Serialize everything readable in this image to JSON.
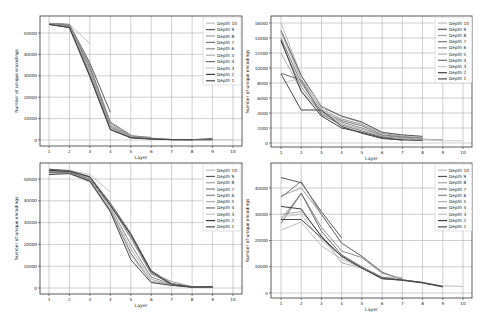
{
  "chart_data": [
    {
      "id": "top-left",
      "type": "line",
      "title": "",
      "xlabel": "Layer",
      "ylabel": "Number of unique encodings",
      "x": [
        1,
        2,
        3,
        4,
        5,
        6,
        7,
        8,
        9,
        10
      ],
      "xticks": [
        "1",
        "2",
        "3",
        "4",
        "5",
        "6",
        "7",
        "8",
        "9",
        "10"
      ],
      "yticks": [
        0,
        10000,
        20000,
        30000,
        40000,
        50000
      ],
      "ytick_labels": [
        "0",
        "10000",
        "20000",
        "30000",
        "40000",
        "50000"
      ],
      "ylim": [
        -2500,
        56000
      ],
      "grid": true,
      "legend_position": "upper right",
      "frame": {
        "left": 40,
        "right": 242,
        "top": 16,
        "bottom": 146,
        "x1px": 49,
        "x10px": 233,
        "y0px": 140,
        "yrefpx": 33,
        "yref": 50000
      },
      "legend_box": {
        "x": 203,
        "y": 17,
        "w": 38,
        "h": 68
      },
      "series": [
        {
          "name": "Depth 10",
          "color": "#bdbdbd",
          "values": [
            54500,
            54000,
            45000
          ]
        },
        {
          "name": "Depth 9",
          "color": "#5a5a5a",
          "values": [
            54500,
            54000,
            36000,
            13000
          ]
        },
        {
          "name": "Depth 8",
          "color": "#a0a0a0",
          "values": [
            54500,
            53800,
            35000,
            8500,
            2500
          ]
        },
        {
          "name": "Depth 7",
          "color": "#7a7a7a",
          "values": [
            54400,
            53500,
            34000,
            8000,
            2000,
            1200
          ]
        },
        {
          "name": "Depth 6",
          "color": "#8c8c8c",
          "values": [
            54300,
            53200,
            33000,
            7000,
            1800,
            900,
            300
          ]
        },
        {
          "name": "Depth 5",
          "color": "#b0b0b0",
          "values": [
            54200,
            53000,
            32000,
            6500,
            1500,
            700,
            250,
            200
          ]
        },
        {
          "name": "Depth 4",
          "color": "#6e6e6e",
          "values": [
            54100,
            53000,
            31000,
            6000,
            1300,
            600,
            200,
            150,
            800
          ]
        },
        {
          "name": "Depth 3",
          "color": "#c8c8c8",
          "values": [
            54000,
            52800,
            30500,
            5500,
            1200,
            500,
            200,
            150,
            100,
            100
          ]
        },
        {
          "name": "Depth 2",
          "color": "#3c3c3c",
          "values": [
            54000,
            52600,
            30000,
            5000,
            1100,
            500,
            150,
            100,
            100
          ]
        },
        {
          "name": "Depth 1",
          "color": "#4a4a4a",
          "values": [
            54000,
            52500,
            29500,
            4800,
            1000,
            400,
            150,
            100
          ]
        }
      ]
    },
    {
      "id": "top-right",
      "type": "line",
      "title": "",
      "xlabel": "Layer",
      "ylabel": "Number of unique encodings",
      "x": [
        1,
        2,
        3,
        4,
        5,
        6,
        7,
        8,
        9,
        10
      ],
      "xticks": [
        "1",
        "2",
        "3",
        "4",
        "5",
        "6",
        "7",
        "8",
        "9",
        "10"
      ],
      "yticks": [
        0,
        2000,
        4000,
        6000,
        8000,
        10000,
        12000,
        14000,
        16000
      ],
      "ytick_labels": [
        "0",
        "2000",
        "4000",
        "6000",
        "8000",
        "10000",
        "12000",
        "14000",
        "16000"
      ],
      "ylim": [
        -500,
        17000
      ],
      "grid": true,
      "legend_position": "upper right",
      "frame": {
        "left": 271,
        "right": 472,
        "top": 16,
        "bottom": 147,
        "x1px": 281,
        "x10px": 463,
        "y0px": 143,
        "yrefpx": 23,
        "yref": 16000
      },
      "legend_box": {
        "x": 435,
        "y": 17,
        "w": 37,
        "h": 66
      },
      "series": [
        {
          "name": "Depth 10",
          "color": "#bdbdbd",
          "values": [
            16000,
            9000,
            5000,
            3500,
            2700,
            1500,
            1000,
            800
          ]
        },
        {
          "name": "Depth 9",
          "color": "#5a5a5a",
          "values": [
            15000,
            9000,
            4800,
            3600,
            2800,
            1400,
            1100,
            900
          ]
        },
        {
          "name": "Depth 8",
          "color": "#a0a0a0",
          "values": [
            14800,
            8500,
            4500,
            3200,
            2500,
            1300,
            900,
            700
          ]
        },
        {
          "name": "Depth 7",
          "color": "#7a7a7a",
          "values": [
            14000,
            8000,
            4200,
            3000,
            2300,
            1100,
            800,
            600
          ]
        },
        {
          "name": "Depth 6",
          "color": "#8c8c8c",
          "values": [
            13500,
            7500,
            4000,
            2800,
            2000,
            1000,
            700,
            500,
            400
          ]
        },
        {
          "name": "Depth 5",
          "color": "#b0b0b0",
          "values": [
            12000,
            7000,
            4000,
            2600,
            1800,
            900,
            600,
            500,
            400
          ]
        },
        {
          "name": "Depth 4",
          "color": "#6e6e6e",
          "values": [
            9300,
            8400,
            3800,
            2400,
            1600,
            800,
            500,
            400
          ]
        },
        {
          "name": "Depth 3",
          "color": "#c8c8c8",
          "values": [
            8000,
            8600,
            5000,
            2300,
            1500,
            700,
            500,
            400,
            300,
            300
          ]
        },
        {
          "name": "Depth 2",
          "color": "#3c3c3c",
          "values": [
            13700,
            6900,
            3600,
            2000,
            1400,
            700,
            400,
            350
          ]
        },
        {
          "name": "Depth 1",
          "color": "#4a4a4a",
          "values": [
            9200,
            4400,
            4400,
            2200,
            1300,
            600,
            400
          ]
        }
      ]
    },
    {
      "id": "bottom-left",
      "type": "line",
      "title": "",
      "xlabel": "Layer",
      "ylabel": "Number of unique encodings",
      "x": [
        1,
        2,
        3,
        4,
        5,
        6,
        7,
        8,
        9,
        10
      ],
      "xticks": [
        "1",
        "2",
        "3",
        "4",
        "5",
        "6",
        "7",
        "8",
        "9",
        "10"
      ],
      "yticks": [
        0,
        10000,
        20000,
        30000,
        40000,
        50000
      ],
      "ytick_labels": [
        "0",
        "10000",
        "20000",
        "30000",
        "40000",
        "50000"
      ],
      "ylim": [
        -2500,
        56000
      ],
      "grid": true,
      "legend_position": "upper right",
      "frame": {
        "left": 40,
        "right": 242,
        "top": 163,
        "bottom": 294,
        "x1px": 49,
        "x10px": 233,
        "y0px": 288,
        "yrefpx": 179,
        "yref": 50000
      },
      "legend_box": {
        "x": 203,
        "y": 164,
        "w": 38,
        "h": 67
      },
      "series": [
        {
          "name": "Depth 10",
          "color": "#bdbdbd",
          "values": [
            54500,
            54000,
            52000,
            44000
          ]
        },
        {
          "name": "Depth 9",
          "color": "#5a5a5a",
          "values": [
            54500,
            53800,
            51000,
            39000,
            25000,
            8000,
            2000,
            500,
            500
          ]
        },
        {
          "name": "Depth 8",
          "color": "#a0a0a0",
          "values": [
            54000,
            53500,
            50500,
            38500,
            24000,
            7000,
            3000,
            600,
            500
          ]
        },
        {
          "name": "Depth 7",
          "color": "#7a7a7a",
          "values": [
            53800,
            53200,
            50000,
            38000,
            23000,
            6500,
            2000,
            500,
            500
          ]
        },
        {
          "name": "Depth 6",
          "color": "#8c8c8c",
          "values": [
            53500,
            53000,
            49500,
            37000,
            20000,
            5000,
            1800,
            400,
            500
          ]
        },
        {
          "name": "Depth 5",
          "color": "#b0b0b0",
          "values": [
            53000,
            53000,
            49000,
            36000,
            18000,
            4000,
            1500,
            400,
            500
          ]
        },
        {
          "name": "Depth 4",
          "color": "#6e6e6e",
          "values": [
            53000,
            52800,
            49000,
            35500,
            16000,
            3000,
            1500,
            400,
            500
          ]
        },
        {
          "name": "Depth 3",
          "color": "#c8c8c8",
          "values": [
            52500,
            52500,
            48500,
            35000,
            15000,
            3000,
            1400,
            400,
            400
          ]
        },
        {
          "name": "Depth 2",
          "color": "#3c3c3c",
          "values": [
            54000,
            53500,
            51000,
            38000,
            24500,
            7500,
            1500,
            500,
            500
          ]
        },
        {
          "name": "Depth 1",
          "color": "#4a4a4a",
          "values": [
            52000,
            52500,
            49000,
            35000,
            13000,
            2500,
            1200,
            300,
            400
          ]
        }
      ]
    },
    {
      "id": "bottom-right",
      "type": "line",
      "title": "",
      "xlabel": "Layer",
      "ylabel": "Number of unique encodings",
      "x": [
        1,
        2,
        3,
        4,
        5,
        6,
        7,
        8,
        9,
        10
      ],
      "xticks": [
        "1",
        "2",
        "3",
        "4",
        "5",
        "6",
        "7",
        "8",
        "9",
        "10"
      ],
      "yticks": [
        0,
        10000,
        20000,
        30000,
        40000
      ],
      "ytick_labels": [
        "0",
        "10000",
        "20000",
        "30000",
        "40000"
      ],
      "ylim": [
        -1000,
        49000
      ],
      "grid": true,
      "legend_position": "upper right",
      "frame": {
        "left": 271,
        "right": 472,
        "top": 163,
        "bottom": 298,
        "x1px": 281,
        "x10px": 463,
        "y0px": 293,
        "yrefpx": 188,
        "yref": 40000
      },
      "legend_box": {
        "x": 435,
        "y": 164,
        "w": 37,
        "h": 67
      },
      "series": [
        {
          "name": "Depth 10",
          "color": "#bdbdbd",
          "values": [
            24000,
            27000,
            18000,
            13000,
            9500,
            5500,
            5000,
            4000,
            2700,
            2500
          ]
        },
        {
          "name": "Depth 9",
          "color": "#5a5a5a",
          "values": [
            44000,
            42000,
            31000,
            21000
          ]
        },
        {
          "name": "Depth 8",
          "color": "#a0a0a0",
          "values": [
            37000,
            40000,
            30000,
            19000,
            14000,
            8000
          ]
        },
        {
          "name": "Depth 7",
          "color": "#7a7a7a",
          "values": [
            36500,
            42500,
            30000,
            19000,
            14000,
            8000,
            5000
          ]
        },
        {
          "name": "Depth 6",
          "color": "#8c8c8c",
          "values": [
            28000,
            38000,
            25000,
            16000,
            13500,
            7500,
            5500
          ]
        },
        {
          "name": "Depth 5",
          "color": "#b0b0b0",
          "values": [
            30000,
            31000,
            22000,
            11500,
            9500,
            6000,
            6000
          ]
        },
        {
          "name": "Depth 4",
          "color": "#6e6e6e",
          "values": [
            26500,
            38000,
            23500,
            14500,
            10000,
            6000,
            5000,
            4000
          ]
        },
        {
          "name": "Depth 3",
          "color": "#c8c8c8",
          "values": [
            29000,
            30000,
            20000,
            14000,
            9500,
            5500,
            5000,
            4000,
            2500
          ]
        },
        {
          "name": "Depth 2",
          "color": "#3c3c3c",
          "values": [
            33000,
            32000,
            21500,
            14000,
            9500,
            5500,
            5000,
            4000,
            2500
          ]
        },
        {
          "name": "Depth 1",
          "color": "#4a4a4a",
          "values": [
            28000,
            28000,
            21000,
            14000,
            9500,
            5500,
            4800,
            3800,
            2300
          ]
        }
      ]
    }
  ]
}
